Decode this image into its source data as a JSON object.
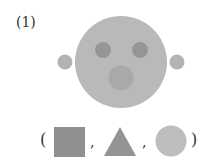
{
  "problem": {
    "label": "(1)",
    "options_open": "(",
    "options_close": ")",
    "separator": ","
  },
  "colors": {
    "face": "#b9b9b9",
    "ear": "#b3b3b3",
    "eye": "#969696",
    "mouth": "#a9a9a9",
    "square": "#8f8f8f",
    "triangle": "#949494",
    "circle": "#bdbdbd"
  },
  "shapes": {
    "face": {
      "shape": "circle-icon",
      "cx": 121,
      "cy": 62,
      "r": 46
    },
    "left_ear": {
      "shape": "circle-icon",
      "cx": 65,
      "cy": 62,
      "r": 7.5
    },
    "right_ear": {
      "shape": "circle-icon",
      "cx": 177,
      "cy": 62,
      "r": 7.5
    },
    "left_eye": {
      "shape": "circle-icon",
      "cx": 103,
      "cy": 50,
      "r": 8
    },
    "right_eye": {
      "shape": "circle-icon",
      "cx": 140,
      "cy": 50,
      "r": 8
    },
    "mouth": {
      "shape": "circle-icon",
      "cx": 121,
      "cy": 78,
      "r": 12.5
    },
    "options": [
      "square-icon",
      "triangle-icon",
      "circle-icon"
    ]
  }
}
